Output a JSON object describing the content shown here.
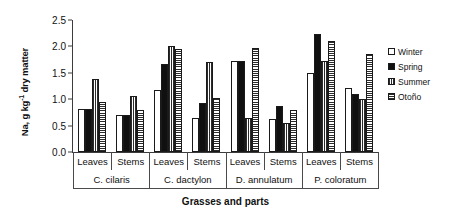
{
  "chart_data": {
    "type": "bar",
    "title": "",
    "xlabel": "Grasses and parts",
    "ylabel": "Na, g kg-1 dry matter",
    "ylabel_main": "Na, g kg",
    "ylabel_exp": "-1",
    "ylabel_tail": " dry matter",
    "ylim": [
      0.0,
      2.5
    ],
    "yticks": [
      "0.0",
      "0.5",
      "1.0",
      "1.5",
      "2.0",
      "2.5"
    ],
    "ytick_values": [
      0.0,
      0.5,
      1.0,
      1.5,
      2.0,
      2.5
    ],
    "grid": false,
    "legend_position": "right",
    "categories": [
      "C. ciliaris Leaves",
      "C. ciliaris Stems",
      "C. dactylon Leaves",
      "C. dactylon Stems",
      "D. annulatum Leaves",
      "D. annulatum Stems",
      "P. coloratum Leaves",
      "P. coloratum Stems"
    ],
    "parts": [
      "Leaves",
      "Stems",
      "Leaves",
      "Stems",
      "Leaves",
      "Stems",
      "Leaves",
      "Stems"
    ],
    "species": [
      "C. cilaris",
      "C. dactylon",
      "D. annulatum",
      "P. coloratum"
    ],
    "series": [
      {
        "name": "Winter",
        "pattern": "open",
        "values": [
          0.82,
          0.7,
          1.17,
          0.65,
          1.73,
          0.63,
          1.5,
          1.22
        ]
      },
      {
        "name": "Spring",
        "pattern": "solid-black",
        "values": [
          0.82,
          0.7,
          1.67,
          0.93,
          1.73,
          0.88,
          2.23,
          1.1
        ]
      },
      {
        "name": "Summer",
        "pattern": "vertical-dots",
        "values": [
          1.38,
          1.06,
          2.0,
          1.7,
          0.65,
          0.55,
          1.73,
          1.0
        ]
      },
      {
        "name": "Otoño",
        "pattern": "horizontal-lines",
        "values": [
          0.95,
          0.8,
          1.96,
          1.03,
          1.97,
          0.8,
          2.11,
          1.85
        ]
      }
    ]
  },
  "legend": {
    "items": [
      {
        "label": "Winter"
      },
      {
        "label": "Spring"
      },
      {
        "label": "Summer"
      },
      {
        "label": "Otoño"
      }
    ]
  }
}
